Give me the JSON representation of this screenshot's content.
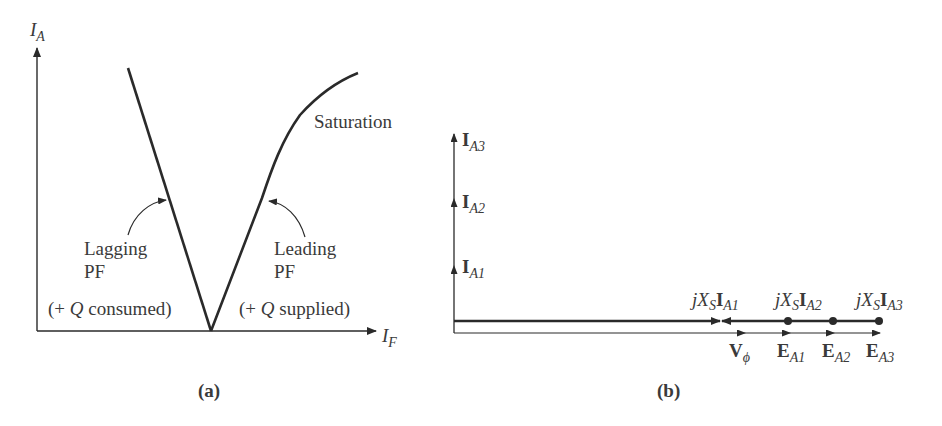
{
  "figure_a": {
    "caption": "(a)",
    "y_axis_label": {
      "main": "I",
      "sub": "A"
    },
    "x_axis_label": {
      "main": "I",
      "sub": "F"
    },
    "curve_label": "Saturation",
    "left_annotation": {
      "line1": "Lagging",
      "line2": "PF",
      "line3_prefix": "(+ ",
      "line3_q": "Q",
      "line3_suffix": " consumed)"
    },
    "right_annotation": {
      "line1": "Leading",
      "line2": "PF",
      "line3_prefix": "(+ ",
      "line3_q": "Q",
      "line3_suffix": " supplied)"
    }
  },
  "figure_b": {
    "caption": "(b)",
    "currents": [
      {
        "main": "I",
        "sub": "A3"
      },
      {
        "main": "I",
        "sub": "A2"
      },
      {
        "main": "I",
        "sub": "A1"
      }
    ],
    "jxs_labels": [
      {
        "j": "jX",
        "s": "S",
        "i": "I",
        "sub": "A1"
      },
      {
        "j": "jX",
        "s": "S",
        "i": "I",
        "sub": "A2"
      },
      {
        "j": "jX",
        "s": "S",
        "i": "I",
        "sub": "A3"
      }
    ],
    "bottom_labels": [
      {
        "main": "V",
        "sub": "ϕ"
      },
      {
        "main": "E",
        "sub": "A1"
      },
      {
        "main": "E",
        "sub": "A2"
      },
      {
        "main": "E",
        "sub": "A3"
      }
    ]
  },
  "colors": {
    "line": "#2a2a2a",
    "text": "#3a3a3a"
  }
}
